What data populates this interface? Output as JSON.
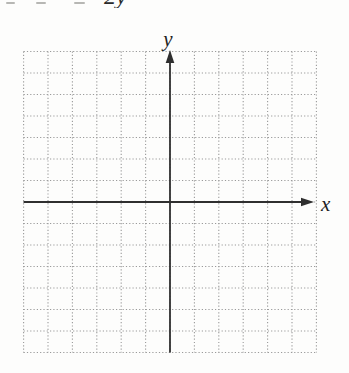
{
  "page": {
    "background": "#fdfdfc",
    "content": "blank dotted coordinate grid with x and y axes, cropped text line at top edge"
  },
  "cropped_top_line": {
    "visible_fragment": "2y"
  },
  "chart_data": {
    "type": "scatter",
    "title": "",
    "xlabel": "x",
    "ylabel": "y",
    "series": [],
    "points": [],
    "grid": "dotted",
    "grid_columns": 12,
    "grid_rows": 14,
    "xlim": [
      -6,
      6
    ],
    "ylim": [
      -7,
      7
    ],
    "legend": "none",
    "axis_arrows": [
      "y-up",
      "x-right"
    ],
    "colors": {
      "grid_dots": "#9a9a9a",
      "axes": "#2f2f2f",
      "paper": "#fdfdfc"
    }
  }
}
